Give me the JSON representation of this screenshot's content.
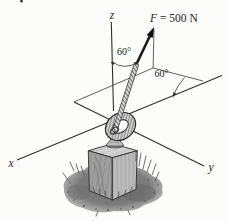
{
  "figure": {
    "type": "statics-force-diagram",
    "axis_labels": {
      "x": "x",
      "y": "y",
      "z": "z"
    },
    "force": {
      "symbol": "F",
      "equation_rest": "= 500 N",
      "magnitude": 500,
      "unit": "N"
    },
    "angles": {
      "from_z_axis": "60°",
      "in_horizontal_plane": "60°"
    },
    "colors": {
      "ink": "#2f2f2f",
      "paper": "#fcfcfb",
      "ground": "#787878",
      "block_light": "#c4c4c4",
      "block_dark": "#a0a0a0"
    }
  }
}
